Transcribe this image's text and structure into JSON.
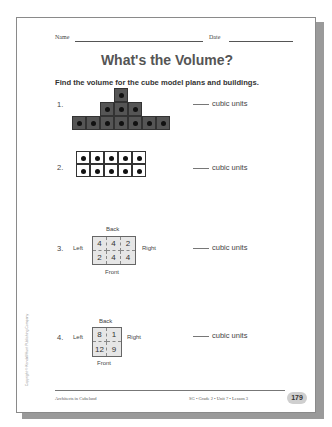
{
  "header": {
    "name_label": "Name",
    "date_label": "Date"
  },
  "title": "What's the Volume?",
  "instructions": "Find the volume for the cube model plans and buildings.",
  "problems": [
    {
      "number": "1.",
      "answer_suffix": "cubic units",
      "type": "cube-building",
      "rows": [
        1,
        3,
        7
      ]
    },
    {
      "number": "2.",
      "answer_suffix": "cubic units",
      "type": "cube-block",
      "rows": 2,
      "cols": 5
    },
    {
      "number": "3.",
      "answer_suffix": "cubic units",
      "type": "plan",
      "labels": {
        "back": "Back",
        "front": "Front",
        "left": "Left",
        "right": "Right"
      },
      "cells": [
        [
          "4",
          "4",
          "2"
        ],
        [
          "2",
          "4",
          "4"
        ]
      ]
    },
    {
      "number": "4.",
      "answer_suffix": "cubic units",
      "type": "plan",
      "labels": {
        "back": "Back",
        "front": "Front",
        "left": "Left",
        "right": "Right"
      },
      "cells": [
        [
          "8",
          "1"
        ],
        [
          "12",
          "9"
        ]
      ]
    }
  ],
  "footer": {
    "left": "Architects in Cubeland",
    "right": "SG • Grade 2 • Unit 7 • Lesson 3",
    "page_number": "179",
    "copyright": "Copyright © Kendall/Hunt Publishing Company"
  }
}
